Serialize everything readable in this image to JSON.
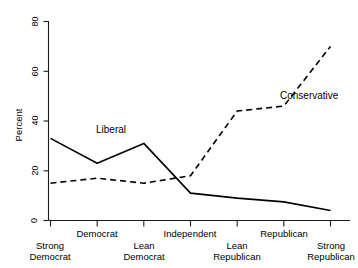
{
  "chart_data": {
    "type": "line",
    "title": "",
    "xlabel": "",
    "ylabel": "Percent",
    "ylim": [
      0,
      80
    ],
    "yticks": [
      0,
      20,
      40,
      60,
      80
    ],
    "ytick_labels": [
      "0",
      "20",
      "40",
      "60",
      "80"
    ],
    "grid": false,
    "legend_position": "inline-annotation",
    "categories": [
      "Strong Democrat",
      "Democrat",
      "Lean Democrat",
      "Independent",
      "Lean Republican",
      "Republican",
      "Strong Republican"
    ],
    "category_lines": [
      [
        "Strong",
        "Democrat"
      ],
      [
        "Democrat"
      ],
      [
        "Lean",
        "Democrat"
      ],
      [
        "Independent"
      ],
      [
        "Lean",
        "Republican"
      ],
      [
        "Republican"
      ],
      [
        "Strong",
        "Republican"
      ]
    ],
    "category_rows": [
      1,
      0,
      1,
      0,
      1,
      0,
      1
    ],
    "series": [
      {
        "name": "Liberal",
        "style": "solid",
        "color": "#000000",
        "values": [
          33,
          23,
          31,
          11,
          9,
          7.5,
          4
        ],
        "label_x": 2,
        "label_y": 37.5
      },
      {
        "name": "Conservative",
        "style": "dashed",
        "color": "#000000",
        "values": [
          15,
          17,
          15,
          18,
          44,
          46,
          70
        ],
        "label_x": 5.45,
        "label_y": 49.5
      }
    ]
  },
  "axis": {
    "y_label": "Percent",
    "y_tick_0": "0",
    "y_tick_1": "20",
    "y_tick_2": "40",
    "y_tick_3": "60",
    "y_tick_4": "80"
  },
  "labels": {
    "liberal": "Liberal",
    "conservative": "Conservative",
    "cat_0_line_0": "Strong",
    "cat_0_line_1": "Democrat",
    "cat_1_line_0": "Democrat",
    "cat_2_line_0": "Lean",
    "cat_2_line_1": "Democrat",
    "cat_3_line_0": "Independent",
    "cat_4_line_0": "Lean",
    "cat_4_line_1": "Republican",
    "cat_5_line_0": "Republican",
    "cat_6_line_0": "Strong",
    "cat_6_line_1": "Republican"
  }
}
